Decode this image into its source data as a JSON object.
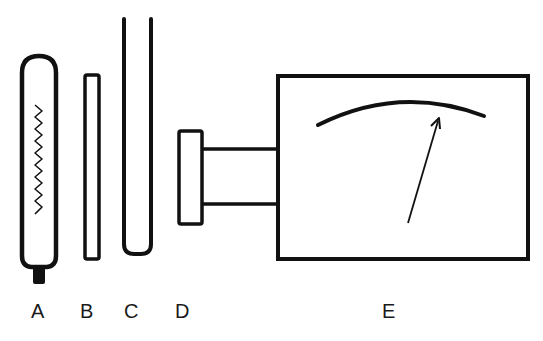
{
  "diagram": {
    "type": "apparatus-schematic",
    "stroke_color": "#111111",
    "background": "#ffffff",
    "components": [
      {
        "id": "A",
        "label": "A",
        "description": "sealed glass tube containing a zig-zag filament, with a base cap"
      },
      {
        "id": "B",
        "label": "B",
        "description": "thin narrow rectangular rod / plate"
      },
      {
        "id": "C",
        "label": "C",
        "description": "tall open-topped U-shaped tube"
      },
      {
        "id": "D",
        "label": "D",
        "description": "small rectangular window connected by a neck to meter E"
      },
      {
        "id": "E",
        "label": "E",
        "description": "rectangular meter box with curved scale and needle pointer"
      }
    ]
  }
}
